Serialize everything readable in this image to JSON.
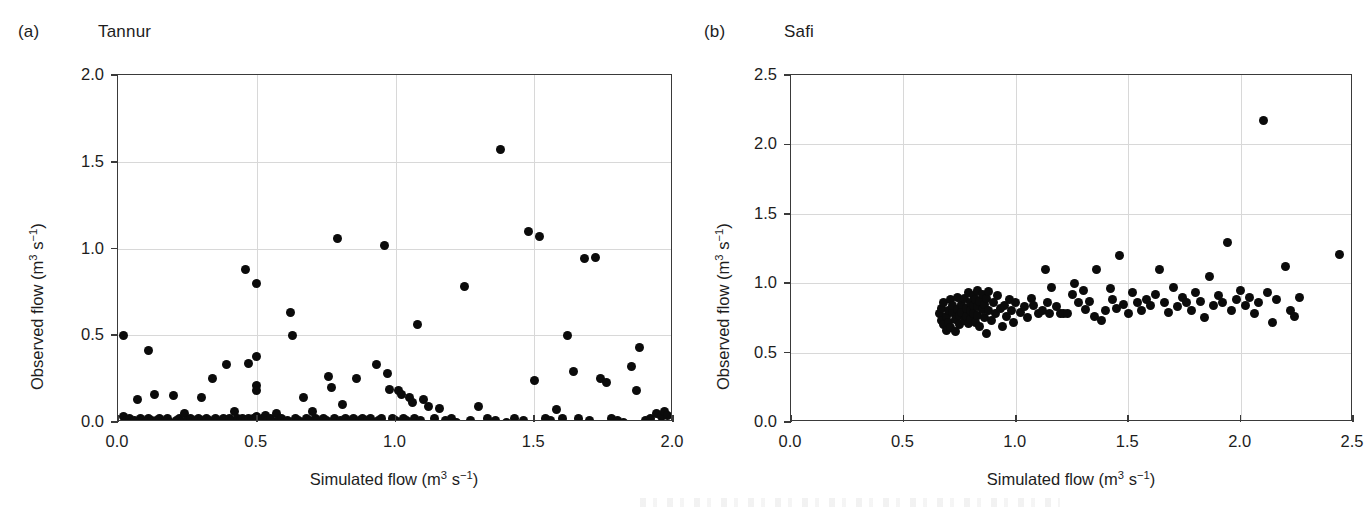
{
  "figure": {
    "background": "#ffffff",
    "marker_color": "#0b0b0b",
    "axis_color": "#3a3a3a",
    "grid_color": "#d8d8d8"
  },
  "panels": [
    {
      "tag": "(a)",
      "title": "Tannur",
      "xlabel_pre": "Simulated flow (m",
      "xlabel_sup": "3",
      "xlabel_mid": " s",
      "xlabel_sup2": "−1",
      "xlabel_post": ")",
      "ylabel_pre": "Observed flow (m",
      "ylabel_sup": "3",
      "ylabel_mid": " s",
      "ylabel_sup2": "−1",
      "ylabel_post": ")",
      "xticks": [
        "0.0",
        "0.5",
        "1.0",
        "1.5",
        "2.0"
      ],
      "yticks": [
        "0.0",
        "0.5",
        "1.0",
        "1.5",
        "2.0"
      ]
    },
    {
      "tag": "(b)",
      "title": "Safi",
      "xlabel_pre": "Simulated flow (m",
      "xlabel_sup": "3",
      "xlabel_mid": " s",
      "xlabel_sup2": "−1",
      "xlabel_post": ")",
      "ylabel_pre": "Observed flow (m",
      "ylabel_sup": "3",
      "ylabel_mid": " s",
      "ylabel_sup2": "−1",
      "ylabel_post": ")",
      "xticks": [
        "0.0",
        "0.5",
        "1.0",
        "1.5",
        "2.0",
        "2.5"
      ],
      "yticks": [
        "0.0",
        "0.5",
        "1.0",
        "1.5",
        "2.0",
        "2.5"
      ]
    }
  ],
  "chart_data": [
    {
      "type": "scatter",
      "title": "Tannur",
      "panel_tag": "(a)",
      "xlabel": "Simulated flow (m3 s-1)",
      "ylabel": "Observed flow (m3 s-1)",
      "xlim": [
        0.0,
        2.0
      ],
      "ylim": [
        0.0,
        2.0
      ],
      "xticks": [
        0.0,
        0.5,
        1.0,
        1.5,
        2.0
      ],
      "yticks": [
        0.0,
        0.5,
        1.0,
        1.5,
        2.0
      ],
      "grid": true,
      "legend": null,
      "marker": "filled-circle",
      "points": [
        [
          0.02,
          0.5
        ],
        [
          0.02,
          0.03
        ],
        [
          0.03,
          0.01
        ],
        [
          0.04,
          0.02
        ],
        [
          0.05,
          0.0
        ],
        [
          0.06,
          0.01
        ],
        [
          0.07,
          0.13
        ],
        [
          0.08,
          0.02
        ],
        [
          0.09,
          0.01
        ],
        [
          0.1,
          0.0
        ],
        [
          0.11,
          0.41
        ],
        [
          0.11,
          0.02
        ],
        [
          0.12,
          0.01
        ],
        [
          0.13,
          0.16
        ],
        [
          0.14,
          0.01
        ],
        [
          0.15,
          0.02
        ],
        [
          0.16,
          0.0
        ],
        [
          0.17,
          0.01
        ],
        [
          0.18,
          0.02
        ],
        [
          0.19,
          0.0
        ],
        [
          0.2,
          0.15
        ],
        [
          0.21,
          0.01
        ],
        [
          0.22,
          0.02
        ],
        [
          0.23,
          0.0
        ],
        [
          0.24,
          0.05
        ],
        [
          0.25,
          0.01
        ],
        [
          0.26,
          0.02
        ],
        [
          0.27,
          0.0
        ],
        [
          0.28,
          0.01
        ],
        [
          0.29,
          0.02
        ],
        [
          0.3,
          0.14
        ],
        [
          0.3,
          0.01
        ],
        [
          0.31,
          0.0
        ],
        [
          0.32,
          0.02
        ],
        [
          0.33,
          0.01
        ],
        [
          0.34,
          0.25
        ],
        [
          0.35,
          0.02
        ],
        [
          0.36,
          0.01
        ],
        [
          0.37,
          0.0
        ],
        [
          0.38,
          0.02
        ],
        [
          0.39,
          0.33
        ],
        [
          0.4,
          0.02
        ],
        [
          0.41,
          0.01
        ],
        [
          0.42,
          0.06
        ],
        [
          0.43,
          0.02
        ],
        [
          0.44,
          0.01
        ],
        [
          0.45,
          0.02
        ],
        [
          0.46,
          0.88
        ],
        [
          0.46,
          0.01
        ],
        [
          0.47,
          0.02
        ],
        [
          0.47,
          0.34
        ],
        [
          0.48,
          0.01
        ],
        [
          0.49,
          0.02
        ],
        [
          0.5,
          0.8
        ],
        [
          0.5,
          0.03
        ],
        [
          0.5,
          0.21
        ],
        [
          0.5,
          0.18
        ],
        [
          0.5,
          0.38
        ],
        [
          0.51,
          0.01
        ],
        [
          0.52,
          0.02
        ],
        [
          0.53,
          0.04
        ],
        [
          0.54,
          0.01
        ],
        [
          0.55,
          0.02
        ],
        [
          0.56,
          0.0
        ],
        [
          0.57,
          0.05
        ],
        [
          0.58,
          0.01
        ],
        [
          0.59,
          0.02
        ],
        [
          0.6,
          0.0
        ],
        [
          0.61,
          0.01
        ],
        [
          0.62,
          0.63
        ],
        [
          0.63,
          0.5
        ],
        [
          0.64,
          0.02
        ],
        [
          0.65,
          0.01
        ],
        [
          0.66,
          0.0
        ],
        [
          0.67,
          0.14
        ],
        [
          0.68,
          0.02
        ],
        [
          0.69,
          0.01
        ],
        [
          0.7,
          0.06
        ],
        [
          0.71,
          0.02
        ],
        [
          0.72,
          0.01
        ],
        [
          0.73,
          0.0
        ],
        [
          0.74,
          0.02
        ],
        [
          0.75,
          0.01
        ],
        [
          0.76,
          0.26
        ],
        [
          0.77,
          0.2
        ],
        [
          0.78,
          0.02
        ],
        [
          0.79,
          1.06
        ],
        [
          0.8,
          0.01
        ],
        [
          0.81,
          0.1
        ],
        [
          0.82,
          0.02
        ],
        [
          0.83,
          0.0
        ],
        [
          0.84,
          0.01
        ],
        [
          0.85,
          0.02
        ],
        [
          0.86,
          0.25
        ],
        [
          0.87,
          0.01
        ],
        [
          0.88,
          0.02
        ],
        [
          0.89,
          0.0
        ],
        [
          0.9,
          0.01
        ],
        [
          0.91,
          0.02
        ],
        [
          0.92,
          0.0
        ],
        [
          0.93,
          0.33
        ],
        [
          0.94,
          0.01
        ],
        [
          0.95,
          0.02
        ],
        [
          0.96,
          1.02
        ],
        [
          0.97,
          0.28
        ],
        [
          0.98,
          0.19
        ],
        [
          0.99,
          0.02
        ],
        [
          1.0,
          0.01
        ],
        [
          1.01,
          0.18
        ],
        [
          1.02,
          0.16
        ],
        [
          1.03,
          0.02
        ],
        [
          1.04,
          0.01
        ],
        [
          1.05,
          0.14
        ],
        [
          1.06,
          0.11
        ],
        [
          1.07,
          0.02
        ],
        [
          1.08,
          0.56
        ],
        [
          1.09,
          0.01
        ],
        [
          1.1,
          0.13
        ],
        [
          1.12,
          0.09
        ],
        [
          1.14,
          0.02
        ],
        [
          1.16,
          0.08
        ],
        [
          1.18,
          0.01
        ],
        [
          1.2,
          0.02
        ],
        [
          1.22,
          0.0
        ],
        [
          1.25,
          0.78
        ],
        [
          1.27,
          0.01
        ],
        [
          1.3,
          0.09
        ],
        [
          1.33,
          0.02
        ],
        [
          1.36,
          0.01
        ],
        [
          1.38,
          1.57
        ],
        [
          1.4,
          0.0
        ],
        [
          1.43,
          0.02
        ],
        [
          1.46,
          0.01
        ],
        [
          1.48,
          1.1
        ],
        [
          1.5,
          0.24
        ],
        [
          1.52,
          1.07
        ],
        [
          1.54,
          0.02
        ],
        [
          1.56,
          0.01
        ],
        [
          1.58,
          0.07
        ],
        [
          1.6,
          0.02
        ],
        [
          1.62,
          0.5
        ],
        [
          1.64,
          0.29
        ],
        [
          1.66,
          0.02
        ],
        [
          1.68,
          0.94
        ],
        [
          1.7,
          0.01
        ],
        [
          1.72,
          0.95
        ],
        [
          1.74,
          0.25
        ],
        [
          1.76,
          0.23
        ],
        [
          1.78,
          0.02
        ],
        [
          1.8,
          0.01
        ],
        [
          1.82,
          0.0
        ],
        [
          1.85,
          0.32
        ],
        [
          1.87,
          0.18
        ],
        [
          1.88,
          0.43
        ],
        [
          1.9,
          0.01
        ],
        [
          1.92,
          0.02
        ],
        [
          1.94,
          0.05
        ],
        [
          1.96,
          0.03
        ],
        [
          1.97,
          0.06
        ],
        [
          1.98,
          0.04
        ]
      ]
    },
    {
      "type": "scatter",
      "title": "Safi",
      "panel_tag": "(b)",
      "xlabel": "Simulated flow (m3 s-1)",
      "ylabel": "Observed flow (m3 s-1)",
      "xlim": [
        0.0,
        2.5
      ],
      "ylim": [
        0.0,
        2.5
      ],
      "xticks": [
        0.0,
        0.5,
        1.0,
        1.5,
        2.0,
        2.5
      ],
      "yticks": [
        0.0,
        0.5,
        1.0,
        1.5,
        2.0,
        2.5
      ],
      "grid": true,
      "legend": null,
      "marker": "filled-circle",
      "points": [
        [
          0.66,
          0.78
        ],
        [
          0.67,
          0.73
        ],
        [
          0.67,
          0.82
        ],
        [
          0.68,
          0.7
        ],
        [
          0.68,
          0.86
        ],
        [
          0.69,
          0.76
        ],
        [
          0.69,
          0.66
        ],
        [
          0.7,
          0.8
        ],
        [
          0.7,
          0.72
        ],
        [
          0.71,
          0.88
        ],
        [
          0.71,
          0.68
        ],
        [
          0.72,
          0.79
        ],
        [
          0.72,
          0.84
        ],
        [
          0.73,
          0.74
        ],
        [
          0.73,
          0.65
        ],
        [
          0.74,
          0.81
        ],
        [
          0.74,
          0.9
        ],
        [
          0.75,
          0.77
        ],
        [
          0.75,
          0.7
        ],
        [
          0.76,
          0.85
        ],
        [
          0.76,
          0.79
        ],
        [
          0.77,
          0.73
        ],
        [
          0.77,
          0.89
        ],
        [
          0.78,
          0.82
        ],
        [
          0.78,
          0.76
        ],
        [
          0.79,
          0.93
        ],
        [
          0.79,
          0.71
        ],
        [
          0.8,
          0.86
        ],
        [
          0.8,
          0.8
        ],
        [
          0.8,
          0.74
        ],
        [
          0.81,
          0.91
        ],
        [
          0.81,
          0.84
        ],
        [
          0.81,
          0.78
        ],
        [
          0.82,
          0.88
        ],
        [
          0.82,
          0.72
        ],
        [
          0.83,
          0.95
        ],
        [
          0.83,
          0.83
        ],
        [
          0.83,
          0.77
        ],
        [
          0.84,
          0.87
        ],
        [
          0.84,
          0.69
        ],
        [
          0.85,
          0.92
        ],
        [
          0.85,
          0.81
        ],
        [
          0.86,
          0.75
        ],
        [
          0.86,
          0.85
        ],
        [
          0.87,
          0.89
        ],
        [
          0.87,
          0.64
        ],
        [
          0.88,
          0.8
        ],
        [
          0.88,
          0.94
        ],
        [
          0.89,
          0.73
        ],
        [
          0.9,
          0.86
        ],
        [
          0.91,
          0.78
        ],
        [
          0.92,
          0.91
        ],
        [
          0.93,
          0.82
        ],
        [
          0.94,
          0.69
        ],
        [
          0.95,
          0.84
        ],
        [
          0.96,
          0.76
        ],
        [
          0.97,
          0.88
        ],
        [
          0.98,
          0.8
        ],
        [
          0.99,
          0.72
        ],
        [
          1.0,
          0.86
        ],
        [
          1.02,
          0.79
        ],
        [
          1.04,
          0.83
        ],
        [
          1.05,
          0.75
        ],
        [
          1.07,
          0.89
        ],
        [
          1.08,
          0.84
        ],
        [
          1.1,
          0.78
        ],
        [
          1.12,
          0.8
        ],
        [
          1.13,
          1.1
        ],
        [
          1.14,
          0.86
        ],
        [
          1.15,
          0.78
        ],
        [
          1.16,
          0.97
        ],
        [
          1.18,
          0.83
        ],
        [
          1.2,
          0.78
        ],
        [
          1.21,
          0.78
        ],
        [
          1.23,
          0.78
        ],
        [
          1.25,
          0.92
        ],
        [
          1.26,
          1.0
        ],
        [
          1.28,
          0.86
        ],
        [
          1.3,
          0.95
        ],
        [
          1.31,
          0.81
        ],
        [
          1.33,
          0.87
        ],
        [
          1.35,
          0.76
        ],
        [
          1.36,
          1.1
        ],
        [
          1.38,
          0.73
        ],
        [
          1.4,
          0.8
        ],
        [
          1.42,
          0.96
        ],
        [
          1.43,
          0.88
        ],
        [
          1.45,
          0.82
        ],
        [
          1.46,
          1.2
        ],
        [
          1.48,
          0.85
        ],
        [
          1.5,
          0.78
        ],
        [
          1.52,
          0.93
        ],
        [
          1.54,
          0.86
        ],
        [
          1.56,
          0.8
        ],
        [
          1.58,
          0.88
        ],
        [
          1.6,
          0.84
        ],
        [
          1.62,
          0.92
        ],
        [
          1.64,
          1.1
        ],
        [
          1.66,
          0.86
        ],
        [
          1.68,
          0.79
        ],
        [
          1.7,
          0.97
        ],
        [
          1.72,
          0.83
        ],
        [
          1.74,
          0.9
        ],
        [
          1.76,
          0.86
        ],
        [
          1.78,
          0.8
        ],
        [
          1.8,
          0.93
        ],
        [
          1.82,
          0.87
        ],
        [
          1.84,
          0.75
        ],
        [
          1.86,
          1.05
        ],
        [
          1.88,
          0.84
        ],
        [
          1.9,
          0.91
        ],
        [
          1.92,
          0.86
        ],
        [
          1.94,
          1.29
        ],
        [
          1.96,
          0.8
        ],
        [
          1.98,
          0.88
        ],
        [
          2.0,
          0.95
        ],
        [
          2.02,
          0.84
        ],
        [
          2.04,
          0.9
        ],
        [
          2.06,
          0.78
        ],
        [
          2.08,
          0.86
        ],
        [
          2.1,
          2.17
        ],
        [
          2.12,
          0.93
        ],
        [
          2.14,
          0.72
        ],
        [
          2.16,
          0.88
        ],
        [
          2.2,
          1.12
        ],
        [
          2.22,
          0.8
        ],
        [
          2.24,
          0.76
        ],
        [
          2.26,
          0.9
        ],
        [
          2.44,
          1.21
        ]
      ]
    }
  ]
}
